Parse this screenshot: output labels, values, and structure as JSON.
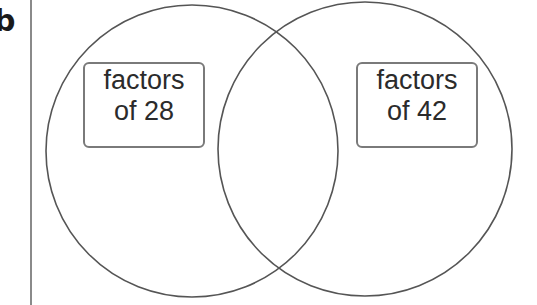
{
  "question_label": "b",
  "diagram": {
    "type": "venn",
    "sets": [
      {
        "id": "left",
        "label_line1": "factors",
        "label_line2": "of 28"
      },
      {
        "id": "right",
        "label_line1": "factors",
        "label_line2": "of 42"
      }
    ],
    "regions": {
      "left_only": "",
      "intersection": "",
      "right_only": ""
    },
    "colors": {
      "circle_stroke": "#555555",
      "label_border": "#7a7a7a",
      "text": "#2b2b2b"
    }
  }
}
